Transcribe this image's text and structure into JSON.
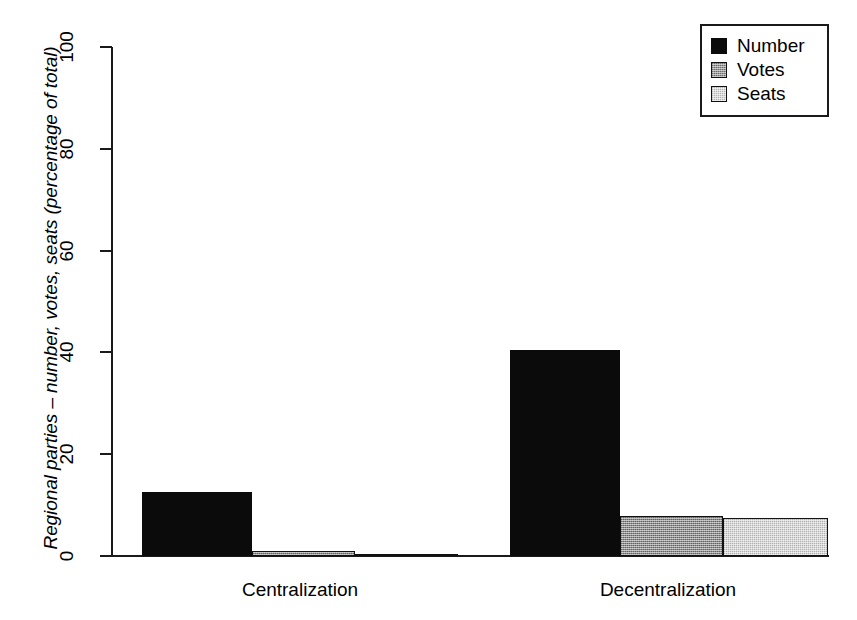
{
  "chart_data": {
    "type": "bar",
    "title": "",
    "subtitle": "",
    "xlabel": "",
    "ylabel": "Regional parties – number, votes, seats (percentage of total)",
    "categories": [
      "Centralization",
      "Decentralization"
    ],
    "series": [
      {
        "name": "Number",
        "values": [
          12.6,
          40.5
        ],
        "color": "#0b0b0b"
      },
      {
        "name": "Votes",
        "values": [
          0.9,
          7.9
        ],
        "color": "#8e8e8e"
      },
      {
        "name": "Seats",
        "values": [
          0.4,
          7.5
        ],
        "color": "#d8d8d8"
      }
    ],
    "ylim": [
      0,
      100
    ],
    "yticks": [
      0,
      20,
      40,
      60,
      80,
      100
    ],
    "ytick_labels": [
      "0",
      "20",
      "40",
      "60",
      "80",
      "100"
    ],
    "grid": false,
    "legend_position": "top-right",
    "legend_entries": [
      "Number",
      "Votes",
      "Seats"
    ]
  },
  "axis": {
    "y_title": "Regional parties – number, votes, seats (percentage of total)",
    "ticks": [
      {
        "label": "100",
        "value": 100
      },
      {
        "label": "80",
        "value": 80
      },
      {
        "label": "60",
        "value": 60
      },
      {
        "label": "40",
        "value": 40
      },
      {
        "label": "20",
        "value": 20
      },
      {
        "label": "0",
        "value": 0
      }
    ]
  },
  "categories": [
    {
      "label": "Centralization"
    },
    {
      "label": "Decentralization"
    }
  ],
  "legend": {
    "items": [
      {
        "label": "Number"
      },
      {
        "label": "Votes"
      },
      {
        "label": "Seats"
      }
    ]
  },
  "bars": [
    {
      "group": "Centralization",
      "series": "Number",
      "value": 12.6
    },
    {
      "group": "Centralization",
      "series": "Votes",
      "value": 0.9
    },
    {
      "group": "Centralization",
      "series": "Seats",
      "value": 0.4
    },
    {
      "group": "Decentralization",
      "series": "Number",
      "value": 40.5
    },
    {
      "group": "Decentralization",
      "series": "Votes",
      "value": 7.9
    },
    {
      "group": "Decentralization",
      "series": "Seats",
      "value": 7.5
    }
  ]
}
